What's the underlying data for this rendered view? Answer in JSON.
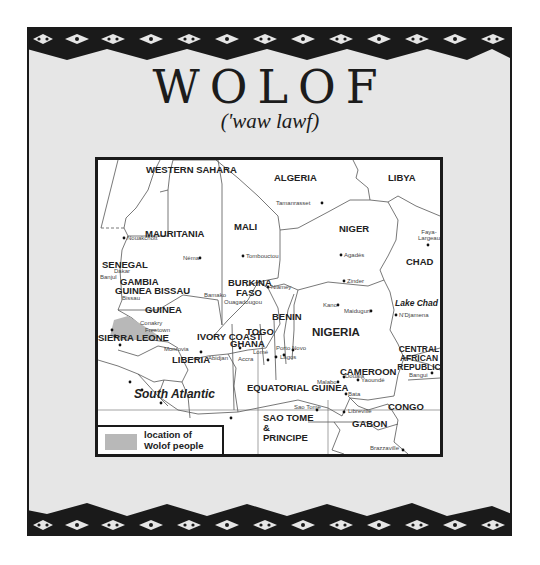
{
  "page": {
    "title": "WOLOF",
    "pronunciation": "('waw lawf)"
  },
  "colors": {
    "panel_background": "#e6e6e6",
    "border_pattern": "#1a1a1a",
    "map_background": "#ffffff",
    "wolof_region": "#b8b8b8"
  },
  "map": {
    "countries": [
      {
        "name": "WESTERN SAHARA"
      },
      {
        "name": "ALGERIA"
      },
      {
        "name": "LIBYA"
      },
      {
        "name": "MAURITANIA"
      },
      {
        "name": "MALI"
      },
      {
        "name": "NIGER"
      },
      {
        "name": "CHAD"
      },
      {
        "name": "SENEGAL"
      },
      {
        "name": "GAMBIA"
      },
      {
        "name": "GUINEA BISSAU"
      },
      {
        "name": "GUINEA"
      },
      {
        "name": "SIERRA LEONE"
      },
      {
        "name": "LIBERIA"
      },
      {
        "name": "IVORY COAST"
      },
      {
        "name": "BURKINA FASO"
      },
      {
        "name": "GHANA"
      },
      {
        "name": "TOGO"
      },
      {
        "name": "BENIN"
      },
      {
        "name": "NIGERIA"
      },
      {
        "name": "CAMEROON"
      },
      {
        "name": "CENTRAL AFRICAN REPUBLIC"
      },
      {
        "name": "EQUATORIAL GUINEA"
      },
      {
        "name": "SAO TOME & PRINCIPE"
      },
      {
        "name": "GABON"
      },
      {
        "name": "CONGO"
      }
    ],
    "cities": [
      {
        "name": "Tamanrasset"
      },
      {
        "name": "Nouakchott"
      },
      {
        "name": "Néma"
      },
      {
        "name": "Tombouctou"
      },
      {
        "name": "Agadès"
      },
      {
        "name": "Faya-Largeau"
      },
      {
        "name": "Zinder"
      },
      {
        "name": "Niamey"
      },
      {
        "name": "Kano"
      },
      {
        "name": "Maiduguri"
      },
      {
        "name": "N'Djamena"
      },
      {
        "name": "Dakar"
      },
      {
        "name": "Banjul"
      },
      {
        "name": "Bissau"
      },
      {
        "name": "Bamako"
      },
      {
        "name": "Ouagadougou"
      },
      {
        "name": "Conakry"
      },
      {
        "name": "Freetown"
      },
      {
        "name": "Monrovia"
      },
      {
        "name": "Abidjan"
      },
      {
        "name": "Accra"
      },
      {
        "name": "Lomé"
      },
      {
        "name": "Porto Novo"
      },
      {
        "name": "Lagos"
      },
      {
        "name": "Douala"
      },
      {
        "name": "Yaoundé"
      },
      {
        "name": "Malabo"
      },
      {
        "name": "Bangui"
      },
      {
        "name": "Bata"
      },
      {
        "name": "Sao Tome"
      },
      {
        "name": "Libreville"
      },
      {
        "name": "Brazzaville"
      }
    ],
    "water": {
      "ocean": "South Atlantic",
      "lake": "Lake Chad"
    },
    "legend": {
      "label_line1": "location of",
      "label_line2": "Wolof people"
    }
  }
}
